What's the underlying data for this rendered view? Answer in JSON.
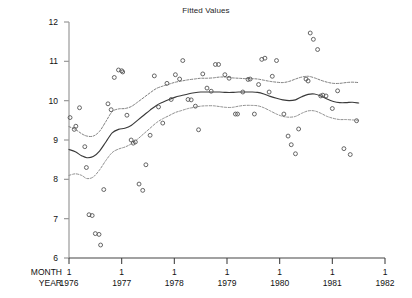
{
  "chart_data": {
    "type": "scatter",
    "title": "Fitted Values",
    "xlabel": "",
    "ylabel": "",
    "grid": false,
    "legend": null,
    "ylim": [
      6,
      12
    ],
    "xlim": [
      1976.0,
      1982.0
    ],
    "yticks": [
      12,
      11,
      10,
      9,
      8,
      7,
      6
    ],
    "ytick_labels": [
      "12",
      "11",
      "10",
      "9",
      "8",
      "7",
      "6"
    ],
    "xticks": [
      1976,
      1977,
      1978,
      1979,
      1980,
      1981,
      1982
    ],
    "x_axis_rows": [
      {
        "row_label": "MONTH",
        "tick_labels": [
          "1",
          "1",
          "1",
          "1",
          "1",
          "1",
          "1"
        ]
      },
      {
        "row_label": "YEAR",
        "tick_labels": [
          "1976",
          "1977",
          "1978",
          "1979",
          "1980",
          "1981",
          "1982"
        ]
      }
    ],
    "series": [
      {
        "name": "observations",
        "type": "scatter",
        "marker": "open-circle",
        "color": "#555555",
        "points": [
          [
            1976.02,
            9.57
          ],
          [
            1976.1,
            9.27
          ],
          [
            1976.13,
            9.35
          ],
          [
            1976.2,
            9.82
          ],
          [
            1976.3,
            8.83
          ],
          [
            1976.33,
            8.3
          ],
          [
            1976.38,
            7.1
          ],
          [
            1976.44,
            7.08
          ],
          [
            1976.5,
            6.62
          ],
          [
            1976.57,
            6.6
          ],
          [
            1976.6,
            6.33
          ],
          [
            1976.66,
            7.74
          ],
          [
            1976.74,
            9.92
          ],
          [
            1976.8,
            9.77
          ],
          [
            1976.86,
            10.59
          ],
          [
            1976.94,
            10.78
          ],
          [
            1977.0,
            10.76
          ],
          [
            1977.02,
            10.73
          ],
          [
            1977.1,
            9.63
          ],
          [
            1977.18,
            9.0
          ],
          [
            1977.22,
            8.92
          ],
          [
            1977.26,
            8.95
          ],
          [
            1977.33,
            7.88
          ],
          [
            1977.4,
            7.72
          ],
          [
            1977.46,
            8.37
          ],
          [
            1977.54,
            9.12
          ],
          [
            1977.62,
            10.63
          ],
          [
            1977.7,
            9.84
          ],
          [
            1977.78,
            9.43
          ],
          [
            1977.86,
            10.44
          ],
          [
            1977.94,
            10.03
          ],
          [
            1978.02,
            10.66
          ],
          [
            1978.1,
            10.55
          ],
          [
            1978.16,
            11.02
          ],
          [
            1978.26,
            10.03
          ],
          [
            1978.32,
            10.02
          ],
          [
            1978.4,
            9.86
          ],
          [
            1978.46,
            9.26
          ],
          [
            1978.54,
            10.68
          ],
          [
            1978.62,
            10.32
          ],
          [
            1978.7,
            10.24
          ],
          [
            1978.78,
            10.92
          ],
          [
            1978.84,
            10.92
          ],
          [
            1978.96,
            10.66
          ],
          [
            1979.04,
            10.57
          ],
          [
            1979.16,
            9.66
          ],
          [
            1979.2,
            9.66
          ],
          [
            1979.3,
            10.22
          ],
          [
            1979.4,
            10.54
          ],
          [
            1979.44,
            10.55
          ],
          [
            1979.52,
            9.66
          ],
          [
            1979.6,
            10.41
          ],
          [
            1979.66,
            11.05
          ],
          [
            1979.72,
            11.08
          ],
          [
            1979.8,
            10.22
          ],
          [
            1979.86,
            10.62
          ],
          [
            1979.94,
            11.02
          ],
          [
            1980.08,
            9.66
          ],
          [
            1980.16,
            9.1
          ],
          [
            1980.22,
            8.88
          ],
          [
            1980.3,
            8.65
          ],
          [
            1980.36,
            9.28
          ],
          [
            1980.5,
            10.55
          ],
          [
            1980.54,
            10.5
          ],
          [
            1980.58,
            11.72
          ],
          [
            1980.64,
            11.56
          ],
          [
            1980.72,
            11.3
          ],
          [
            1980.78,
            10.12
          ],
          [
            1980.82,
            10.14
          ],
          [
            1980.88,
            10.12
          ],
          [
            1981.0,
            9.8
          ],
          [
            1981.1,
            10.25
          ],
          [
            1981.22,
            8.78
          ],
          [
            1981.34,
            8.63
          ],
          [
            1981.46,
            9.49
          ]
        ]
      },
      {
        "name": "fit",
        "type": "line",
        "style": "solid",
        "color": "#3a3a3a",
        "points": [
          [
            1976.0,
            8.76
          ],
          [
            1976.12,
            8.7
          ],
          [
            1976.24,
            8.6
          ],
          [
            1976.34,
            8.55
          ],
          [
            1976.46,
            8.58
          ],
          [
            1976.58,
            8.72
          ],
          [
            1976.7,
            8.95
          ],
          [
            1976.82,
            9.18
          ],
          [
            1976.94,
            9.27
          ],
          [
            1977.06,
            9.3
          ],
          [
            1977.18,
            9.37
          ],
          [
            1977.3,
            9.5
          ],
          [
            1977.42,
            9.63
          ],
          [
            1977.54,
            9.76
          ],
          [
            1977.66,
            9.88
          ],
          [
            1977.78,
            9.96
          ],
          [
            1977.9,
            10.03
          ],
          [
            1978.02,
            10.09
          ],
          [
            1978.14,
            10.13
          ],
          [
            1978.26,
            10.17
          ],
          [
            1978.38,
            10.2
          ],
          [
            1978.5,
            10.22
          ],
          [
            1978.62,
            10.22
          ],
          [
            1978.74,
            10.22
          ],
          [
            1978.86,
            10.22
          ],
          [
            1978.98,
            10.21
          ],
          [
            1979.1,
            10.21
          ],
          [
            1979.22,
            10.22
          ],
          [
            1979.34,
            10.22
          ],
          [
            1979.46,
            10.22
          ],
          [
            1979.58,
            10.21
          ],
          [
            1979.7,
            10.17
          ],
          [
            1979.82,
            10.11
          ],
          [
            1979.94,
            10.06
          ],
          [
            1980.06,
            10.02
          ],
          [
            1980.18,
            10.0
          ],
          [
            1980.3,
            10.02
          ],
          [
            1980.42,
            10.1
          ],
          [
            1980.54,
            10.16
          ],
          [
            1980.66,
            10.17
          ],
          [
            1980.78,
            10.12
          ],
          [
            1980.9,
            10.04
          ],
          [
            1981.02,
            9.98
          ],
          [
            1981.14,
            9.95
          ],
          [
            1981.26,
            9.95
          ],
          [
            1981.38,
            9.96
          ],
          [
            1981.5,
            9.94
          ]
        ]
      },
      {
        "name": "upper-confidence-band",
        "type": "line",
        "style": "dotted",
        "color": "#777777",
        "points": [
          [
            1976.0,
            9.34
          ],
          [
            1976.12,
            9.27
          ],
          [
            1976.24,
            9.16
          ],
          [
            1976.34,
            9.1
          ],
          [
            1976.46,
            9.1
          ],
          [
            1976.58,
            9.22
          ],
          [
            1976.7,
            9.47
          ],
          [
            1976.82,
            9.72
          ],
          [
            1976.94,
            9.79
          ],
          [
            1977.06,
            9.8
          ],
          [
            1977.18,
            9.85
          ],
          [
            1977.3,
            9.96
          ],
          [
            1977.42,
            10.08
          ],
          [
            1977.54,
            10.2
          ],
          [
            1977.66,
            10.31
          ],
          [
            1977.78,
            10.37
          ],
          [
            1977.9,
            10.42
          ],
          [
            1978.02,
            10.47
          ],
          [
            1978.14,
            10.5
          ],
          [
            1978.26,
            10.53
          ],
          [
            1978.38,
            10.55
          ],
          [
            1978.5,
            10.57
          ],
          [
            1978.62,
            10.57
          ],
          [
            1978.74,
            10.58
          ],
          [
            1978.86,
            10.6
          ],
          [
            1978.98,
            10.6
          ],
          [
            1979.1,
            10.58
          ],
          [
            1979.22,
            10.57
          ],
          [
            1979.34,
            10.56
          ],
          [
            1979.46,
            10.56
          ],
          [
            1979.58,
            10.55
          ],
          [
            1979.7,
            10.52
          ],
          [
            1979.82,
            10.49
          ],
          [
            1979.94,
            10.47
          ],
          [
            1980.06,
            10.46
          ],
          [
            1980.18,
            10.49
          ],
          [
            1980.3,
            10.55
          ],
          [
            1980.42,
            10.6
          ],
          [
            1980.54,
            10.62
          ],
          [
            1980.66,
            10.58
          ],
          [
            1980.78,
            10.52
          ],
          [
            1980.9,
            10.47
          ],
          [
            1981.02,
            10.44
          ],
          [
            1981.14,
            10.44
          ],
          [
            1981.26,
            10.46
          ],
          [
            1981.38,
            10.47
          ],
          [
            1981.5,
            10.46
          ]
        ]
      },
      {
        "name": "lower-confidence-band",
        "type": "line",
        "style": "dotted",
        "color": "#888888",
        "points": [
          [
            1976.0,
            8.1
          ],
          [
            1976.12,
            8.14
          ],
          [
            1976.24,
            8.1
          ],
          [
            1976.34,
            8.02
          ],
          [
            1976.46,
            8.06
          ],
          [
            1976.58,
            8.24
          ],
          [
            1976.7,
            8.48
          ],
          [
            1976.82,
            8.68
          ],
          [
            1976.94,
            8.77
          ],
          [
            1977.06,
            8.82
          ],
          [
            1977.18,
            8.9
          ],
          [
            1977.3,
            9.02
          ],
          [
            1977.42,
            9.16
          ],
          [
            1977.54,
            9.3
          ],
          [
            1977.66,
            9.44
          ],
          [
            1977.78,
            9.54
          ],
          [
            1977.9,
            9.62
          ],
          [
            1978.02,
            9.7
          ],
          [
            1978.14,
            9.75
          ],
          [
            1978.26,
            9.8
          ],
          [
            1978.38,
            9.83
          ],
          [
            1978.5,
            9.86
          ],
          [
            1978.62,
            9.87
          ],
          [
            1978.74,
            9.87
          ],
          [
            1978.86,
            9.85
          ],
          [
            1978.98,
            9.83
          ],
          [
            1979.1,
            9.83
          ],
          [
            1979.22,
            9.86
          ],
          [
            1979.34,
            9.88
          ],
          [
            1979.46,
            9.88
          ],
          [
            1979.58,
            9.87
          ],
          [
            1979.7,
            9.82
          ],
          [
            1979.82,
            9.74
          ],
          [
            1979.94,
            9.66
          ],
          [
            1980.06,
            9.6
          ],
          [
            1980.18,
            9.58
          ],
          [
            1980.3,
            9.6
          ],
          [
            1980.42,
            9.68
          ],
          [
            1980.54,
            9.74
          ],
          [
            1980.66,
            9.74
          ],
          [
            1980.78,
            9.68
          ],
          [
            1980.9,
            9.6
          ],
          [
            1981.02,
            9.55
          ],
          [
            1981.14,
            9.52
          ],
          [
            1981.26,
            9.52
          ],
          [
            1981.38,
            9.51
          ],
          [
            1981.5,
            9.5
          ]
        ]
      }
    ]
  }
}
